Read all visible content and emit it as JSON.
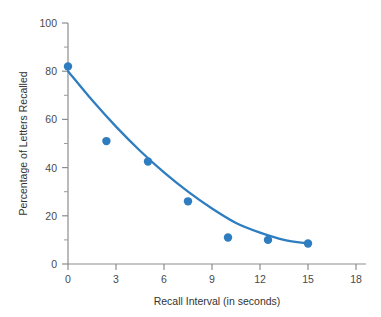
{
  "chart_data": {
    "type": "scatter",
    "title": "",
    "xlabel": "Recall Interval (in seconds)",
    "ylabel": "Percentage of Letters Recalled",
    "xlim": [
      0,
      18
    ],
    "ylim": [
      0,
      100
    ],
    "xticks": [
      0,
      3,
      6,
      9,
      12,
      15,
      18
    ],
    "xtick_labels": [
      "0",
      "3",
      "6",
      "9",
      "12",
      "15",
      "18"
    ],
    "yticks": [
      0,
      20,
      40,
      60,
      80,
      100
    ],
    "ytick_labels": [
      "0",
      "20",
      "40",
      "60",
      "80",
      "100"
    ],
    "y_minor_ticks": [
      10,
      30,
      50,
      70,
      90
    ],
    "grid": false,
    "legend": null,
    "series": [
      {
        "name": "Percentage of Letters Recalled",
        "marker": "circle",
        "color": "#2e7dc0",
        "x": [
          0,
          2.4,
          5.0,
          7.5,
          10.0,
          12.5,
          15.0
        ],
        "values": [
          82,
          51,
          42.5,
          26,
          11,
          10,
          8.5
        ]
      },
      {
        "name": "fitted decay curve",
        "marker": "none",
        "color": "#2e7dc0",
        "x": [
          0,
          1.5,
          3,
          4.5,
          6,
          7.5,
          9,
          10.5,
          12,
          13.5,
          15
        ],
        "values": [
          80,
          68,
          57,
          47,
          38,
          30,
          23,
          17,
          13,
          10,
          8.5
        ]
      }
    ]
  },
  "axes": {
    "x_title": "Recall Interval (in seconds)",
    "y_title": "Percentage of Letters Recalled",
    "x_tick_labels": [
      "0",
      "3",
      "6",
      "9",
      "12",
      "15",
      "18"
    ],
    "y_tick_labels": [
      "0",
      "20",
      "40",
      "60",
      "80",
      "100"
    ]
  },
  "colors": {
    "accent": "#2e7dc0",
    "axis": "#8d8d8d",
    "text": "#4a4a4a",
    "background": "#ffffff"
  }
}
